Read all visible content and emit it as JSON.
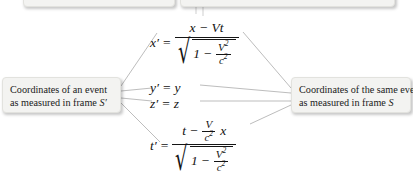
{
  "figure": {
    "background": "#ffffff",
    "line_color": "#b4b4b4",
    "text_color": "#121212"
  },
  "callouts": {
    "left": {
      "line1": "Coordinates of an event",
      "line2_prefix": "as measured in frame ",
      "line2_symbol": "S′"
    },
    "right": {
      "line1": "Coordinates of the same event",
      "line2_prefix": "as measured in frame ",
      "line2_symbol": "S"
    },
    "top_left": {
      "text": ""
    },
    "top_right": {
      "text": ""
    }
  },
  "equations": {
    "x_prime": {
      "lhs": "x′",
      "equals": "=",
      "numerator": "x − Vt",
      "denominator_radicand_one": "1",
      "denominator_minus": "−",
      "denominator_frac_num": "V",
      "denominator_frac_num_exp": "2",
      "denominator_frac_den": "c",
      "denominator_frac_den_exp": "2",
      "radical_sign": "√"
    },
    "y_prime": {
      "lhs": "y′",
      "equals": "=",
      "rhs": "y"
    },
    "z_prime": {
      "lhs": "z′",
      "equals": "=",
      "rhs": "z"
    },
    "t_prime": {
      "lhs": "t′",
      "equals": "=",
      "numerator_t": "t",
      "numerator_minus": "−",
      "numerator_frac_num": "V",
      "numerator_frac_den": "c",
      "numerator_frac_den_exp": "2",
      "numerator_x": "x",
      "denominator_radicand_one": "1",
      "denominator_minus": "−",
      "denominator_frac_num": "V",
      "denominator_frac_num_exp": "2",
      "denominator_frac_den": "c",
      "denominator_frac_den_exp": "2",
      "radical_sign": "√"
    }
  }
}
